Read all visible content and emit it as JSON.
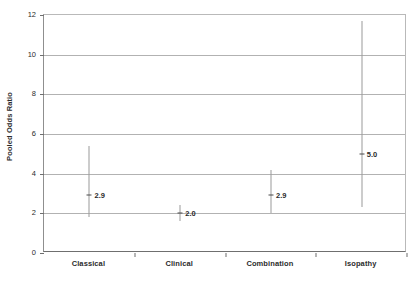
{
  "chart_data": {
    "type": "scatter",
    "title": "",
    "xlabel": "",
    "ylabel": "Pooled Odds Ratio",
    "categories": [
      "Classical",
      "Clinical",
      "Combination",
      "Isopathy"
    ],
    "values": [
      2.9,
      2.0,
      2.9,
      5.0
    ],
    "labels": [
      "2.9",
      "2.0",
      "2.9",
      "5.0"
    ],
    "error_bars": [
      {
        "low": 1.8,
        "high": 5.4
      },
      {
        "low": 1.6,
        "high": 2.4
      },
      {
        "low": 2.0,
        "high": 4.2
      },
      {
        "low": 2.3,
        "high": 11.7
      }
    ],
    "ylim": [
      0,
      12
    ],
    "yticks": [
      0,
      2,
      4,
      6,
      8,
      10,
      12
    ],
    "ytick_labels": [
      "0",
      "2",
      "4",
      "6",
      "8",
      "10",
      "12"
    ],
    "grid": true,
    "legend": "none"
  },
  "colors": {
    "gridline": "#b2b2b2",
    "error_bar": "#9a9a9a",
    "point_marker": "#4a4a4a",
    "axis": "#6f6f6f",
    "text": "#2b2b2b",
    "background": "#ffffff"
  }
}
